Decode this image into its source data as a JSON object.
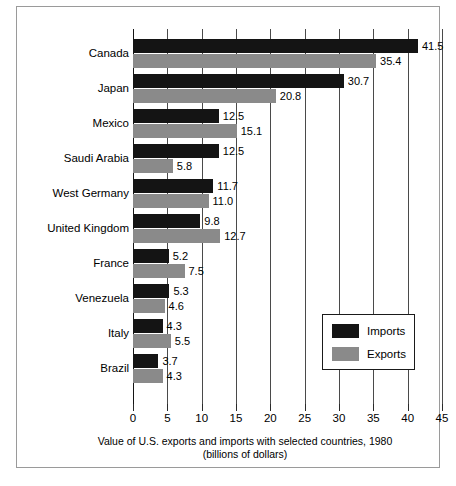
{
  "chart_data": {
    "type": "bar",
    "orientation": "horizontal",
    "title": "",
    "caption_line1": "Value of U.S. exports and imports with selected countries, 1980",
    "caption_line2": "(billions of dollars)",
    "xlabel": "",
    "ylabel": "",
    "xlim": [
      0,
      45
    ],
    "xticks": [
      0,
      5,
      10,
      15,
      20,
      25,
      30,
      35,
      40,
      45
    ],
    "xtick_labels": [
      "0",
      "5",
      "10",
      "15",
      "20",
      "25",
      "30",
      "35",
      "40",
      "45"
    ],
    "grid": true,
    "grid_axis": "x",
    "legend_position": "lower-right",
    "categories": [
      "Canada",
      "Japan",
      "Mexico",
      "Saudi Arabia",
      "West Germany",
      "United Kingdom",
      "France",
      "Venezuela",
      "Italy",
      "Brazil"
    ],
    "series": [
      {
        "name": "Imports",
        "color": "#141414",
        "values": [
          41.5,
          30.7,
          12.5,
          12.5,
          11.7,
          9.8,
          5.2,
          5.3,
          4.3,
          3.7
        ],
        "value_labels": [
          "41.5",
          "30.7",
          "12.5",
          "12.5",
          "11.7",
          "9.8",
          "5.2",
          "5.3",
          "4.3",
          "3.7"
        ]
      },
      {
        "name": "Exports",
        "color": "#8a8a8a",
        "values": [
          35.4,
          20.8,
          15.1,
          5.8,
          11.0,
          12.7,
          7.5,
          4.6,
          5.5,
          4.3
        ],
        "value_labels": [
          "35.4",
          "20.8",
          "15.1",
          "5.8",
          "11.0",
          "12.7",
          "7.5",
          "4.6",
          "5.5",
          "4.3"
        ]
      }
    ]
  },
  "legend": {
    "items": [
      {
        "label": "Imports",
        "color": "#141414"
      },
      {
        "label": "Exports",
        "color": "#8a8a8a"
      }
    ]
  }
}
